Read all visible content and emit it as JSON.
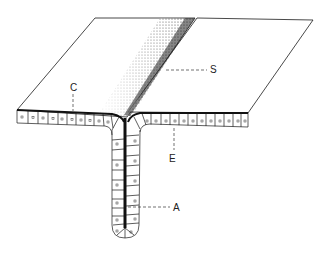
{
  "figure": {
    "labels": [
      {
        "id": "S",
        "text": "S",
        "x": 210,
        "y": 65
      },
      {
        "id": "C",
        "text": "C",
        "x": 70,
        "y": 83
      },
      {
        "id": "E",
        "text": "E",
        "x": 169,
        "y": 154
      },
      {
        "id": "A",
        "text": "A",
        "x": 173,
        "y": 203
      }
    ],
    "colors": {
      "line": "#1a1a1a",
      "background": "#ffffff",
      "stipple": "#333333"
    }
  }
}
